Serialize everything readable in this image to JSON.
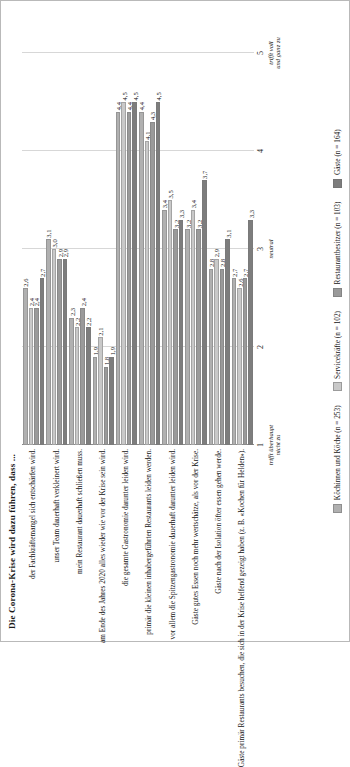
{
  "chart_data": {
    "type": "bar",
    "title": "Die Corona-Krise wird dazu führen, dass ...",
    "orientation": "vertical",
    "xlabel": "",
    "ylabel": "",
    "ylim": [
      1,
      5
    ],
    "grid": true,
    "legend_position": "bottom",
    "axis_ticks": [
      {
        "value": 1,
        "label": "1",
        "desc": "trifft überhaupt\nnicht zu"
      },
      {
        "value": 2,
        "label": "2",
        "desc": ""
      },
      {
        "value": 3,
        "label": "3",
        "desc": "neutral"
      },
      {
        "value": 4,
        "label": "4",
        "desc": ""
      },
      {
        "value": 5,
        "label": "5",
        "desc": "trifft voll\nund ganz zu"
      }
    ],
    "categories": [
      "der Fachkräftemangel sich entschärfen wird.",
      "unser Team dauerhaft verkleinert wird.",
      "mein Restaurant dauerhaft schließen muss.",
      "am Ende des Jahres 2020 alles wieder wie vor der Krise sein wird.",
      "die gesamte Gastronomie darunter leiden wird.",
      "primär die kleinen inhabergeführten Restaurants leiden werden.",
      "vor allem die Spitzengastronomie dauerhaft darunter leiden wird.",
      "Gäste gutes Essen noch mehr wertschätze, als vor der Krise.",
      "Gäste nach der Isolation öfter essen gehen werde.",
      "Gäste primär Restaurants besuchen, die sich in der Krise helfend gezeigt haben (z. B. «Kochen für Helden»)."
    ],
    "series": [
      {
        "name": "Köchinnen und Köche (n = 253)",
        "color": "#b0b0b0",
        "values": [
          2.6,
          3.1,
          2.3,
          1.9,
          4.4,
          4.4,
          3.4,
          3.2,
          2.8,
          2.7
        ]
      },
      {
        "name": "Servicekräfte (n = 102)",
        "color": "#c9c9c9",
        "values": [
          2.4,
          3.0,
          2.2,
          2.1,
          4.5,
          4.1,
          3.5,
          3.4,
          2.9,
          2.6
        ]
      },
      {
        "name": "Restaurantbesitzer (n = 103)",
        "color": "#9a9a9a",
        "values": [
          2.4,
          2.9,
          2.4,
          1.8,
          4.4,
          4.3,
          3.2,
          3.2,
          2.8,
          2.7
        ]
      },
      {
        "name": "Gäste (n = 164)",
        "color": "#7d7d7d",
        "values": [
          2.7,
          2.9,
          2.2,
          1.9,
          4.5,
          4.5,
          3.3,
          3.7,
          3.1,
          3.3
        ]
      }
    ]
  }
}
